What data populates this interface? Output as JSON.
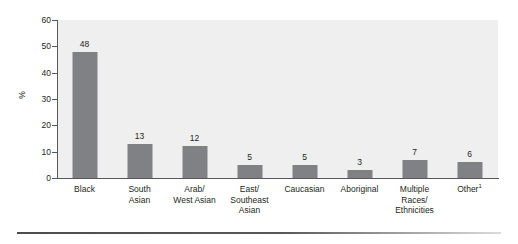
{
  "chart_data": {
    "type": "bar",
    "title": "",
    "subtitle": "",
    "xlabel": "",
    "ylabel": "%",
    "ylim": [
      0,
      60
    ],
    "yticks": [
      0,
      10,
      20,
      30,
      40,
      50,
      60
    ],
    "grid": false,
    "legend": "none",
    "categories": [
      "Black",
      "South Asian",
      "Arab/ West Asian",
      "East/ Southeast Asian",
      "Caucasian",
      "Aboriginal",
      "Multiple Races/ Ethnicities",
      "Other"
    ],
    "category_lines": [
      [
        "Black"
      ],
      [
        "South",
        "Asian"
      ],
      [
        "Arab/",
        "West Asian"
      ],
      [
        "East/",
        "Southeast",
        "Asian"
      ],
      [
        "Caucasian"
      ],
      [
        "Aboriginal"
      ],
      [
        "Multiple",
        "Races/",
        "Ethnicities"
      ],
      [
        "Other"
      ]
    ],
    "values": [
      48,
      13,
      12,
      5,
      5,
      3,
      7,
      6
    ],
    "data_labels": [
      "48",
      "13",
      "12",
      "5",
      "5",
      "3",
      "7",
      "6"
    ],
    "footnote_marker": "1",
    "footnote_on_category": "Other",
    "colors": {
      "bar": "#808184",
      "plot_background": "#efefef",
      "axis": "#58585a",
      "text": "#231f20",
      "page_background": "#ffffff",
      "footer_rule": "#58585a"
    }
  }
}
